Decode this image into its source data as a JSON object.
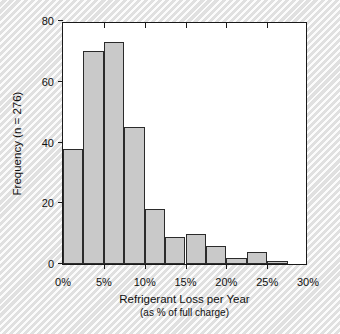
{
  "chart_data": {
    "type": "bar",
    "title": "",
    "subtitle": "",
    "xlabel": "Refrigerant Loss per Year",
    "xlabel_sub": "(as % of full charge)",
    "ylabel": "Frequency (n = 276)",
    "sample_size": 276,
    "bin_width": 2.5,
    "xlim": [
      0,
      30
    ],
    "ylim": [
      0,
      80
    ],
    "grid": false,
    "legend": false,
    "bar_color": "#c9c9c9",
    "bar_edge_color": "#2b2b2b",
    "x_tick_labels": [
      "0%",
      "5%",
      "10%",
      "15%",
      "20%",
      "25%",
      "30%"
    ],
    "x_tick_values": [
      0,
      5,
      10,
      15,
      20,
      25,
      30
    ],
    "y_tick_labels": [
      "0",
      "20",
      "40",
      "60",
      "80"
    ],
    "y_tick_values": [
      0,
      20,
      40,
      60,
      80
    ],
    "bins": [
      {
        "start": 0.0,
        "end": 2.5,
        "label": "0–2.5%",
        "value": 38
      },
      {
        "start": 2.5,
        "end": 5.0,
        "label": "2.5–5%",
        "value": 70
      },
      {
        "start": 5.0,
        "end": 7.5,
        "label": "5–7.5%",
        "value": 73
      },
      {
        "start": 7.5,
        "end": 10.0,
        "label": "7.5–10%",
        "value": 45
      },
      {
        "start": 10.0,
        "end": 12.5,
        "label": "10–12.5%",
        "value": 18
      },
      {
        "start": 12.5,
        "end": 15.0,
        "label": "12.5–15%",
        "value": 9
      },
      {
        "start": 15.0,
        "end": 17.5,
        "label": "15–17.5%",
        "value": 10
      },
      {
        "start": 17.5,
        "end": 20.0,
        "label": "17.5–20%",
        "value": 6
      },
      {
        "start": 20.0,
        "end": 22.5,
        "label": "20–22.5%",
        "value": 2
      },
      {
        "start": 22.5,
        "end": 25.0,
        "label": "22.5–25%",
        "value": 4
      },
      {
        "start": 25.0,
        "end": 27.5,
        "label": "25–27.5%",
        "value": 1
      },
      {
        "start": 27.5,
        "end": 30.0,
        "label": "27.5–30%",
        "value": 0
      }
    ],
    "categories": [
      "0–2.5%",
      "2.5–5%",
      "5–7.5%",
      "7.5–10%",
      "10–12.5%",
      "12.5–15%",
      "15–17.5%",
      "17.5–20%",
      "20–22.5%",
      "22.5–25%",
      "25–27.5%",
      "27.5–30%"
    ],
    "values": [
      38,
      70,
      73,
      45,
      18,
      9,
      10,
      6,
      2,
      4,
      1,
      0
    ]
  }
}
